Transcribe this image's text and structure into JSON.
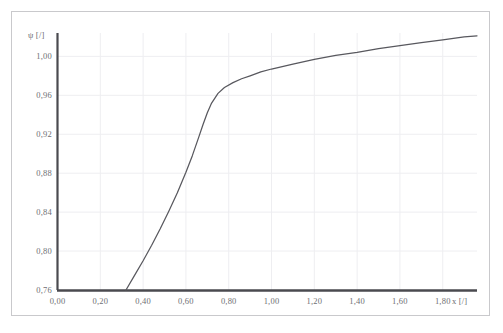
{
  "figure": {
    "scan_artifact_text": "",
    "frame_color": "#c9c9cc",
    "background_color": "#ffffff",
    "axis_color": "#4a4a4f",
    "grid_color": "#eeeef1",
    "curve_color": "#58585e",
    "label_color": "#6f6f74"
  },
  "chart_data": {
    "type": "line",
    "title": "",
    "xlabel": "x [/]",
    "ylabel": "ψ [/]",
    "xlim": [
      0.0,
      1.96
    ],
    "ylim": [
      0.76,
      1.024
    ],
    "grid": true,
    "legend": null,
    "x_ticks": [
      0.0,
      0.2,
      0.4,
      0.6,
      0.8,
      1.0,
      1.2,
      1.4,
      1.6,
      1.8
    ],
    "x_tick_labels": [
      "0,00",
      "0,20",
      "0,40",
      "0,60",
      "0,80",
      "1,00",
      "1,20",
      "1,40",
      "1,60",
      "1,80"
    ],
    "y_ticks": [
      0.76,
      0.8,
      0.84,
      0.88,
      0.92,
      0.96,
      1.0
    ],
    "y_tick_labels": [
      "0,76",
      "0,80",
      "0,84",
      "0,88",
      "0,92",
      "0,96",
      "1,00"
    ],
    "series": [
      {
        "name": "ψ(x)",
        "color": "#58585e",
        "x": [
          0.32,
          0.36,
          0.4,
          0.44,
          0.48,
          0.52,
          0.56,
          0.6,
          0.63,
          0.66,
          0.68,
          0.7,
          0.72,
          0.75,
          0.78,
          0.82,
          0.86,
          0.9,
          0.95,
          1.0,
          1.1,
          1.2,
          1.3,
          1.4,
          1.5,
          1.6,
          1.7,
          1.8,
          1.9,
          1.96
        ],
        "y": [
          0.76,
          0.775,
          0.79,
          0.806,
          0.823,
          0.841,
          0.86,
          0.881,
          0.898,
          0.917,
          0.93,
          0.942,
          0.952,
          0.962,
          0.968,
          0.973,
          0.977,
          0.98,
          0.984,
          0.987,
          0.992,
          0.997,
          1.001,
          1.004,
          1.008,
          1.011,
          1.014,
          1.017,
          1.02,
          1.021
        ]
      }
    ],
    "annotations": []
  },
  "axis_titles": {
    "y": "ψ [/]",
    "x": "x [/]"
  }
}
